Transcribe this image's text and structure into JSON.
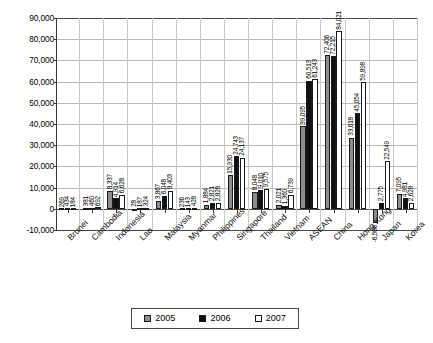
{
  "chart_data": {
    "type": "bar",
    "title": "",
    "xlabel": "",
    "ylabel": "",
    "ylim": [
      -10000,
      90000
    ],
    "yticks": [
      "-10,000",
      "0",
      "10,000",
      "20,000",
      "30,000",
      "40,000",
      "50,000",
      "60,000",
      "70,000",
      "80,000",
      "90,000"
    ],
    "grid": true,
    "legend_position": "bottom",
    "categories": [
      "Brunei",
      "Cambodia",
      "Indonesia",
      "Lao",
      "Malaysia",
      "Myanmar",
      "Philippines",
      "Singapore",
      "Thailand",
      "Vietnam",
      "ASEAN",
      "China",
      "Hong Kong",
      "Japan",
      "Korea"
    ],
    "series": [
      {
        "name": "2005",
        "color": "#8c8c8c",
        "values": [
          269,
          381,
          8337,
          28,
          3867,
          236,
          1884,
          15930,
          8048,
          2021,
          39095,
          72406,
          33618,
          -6506,
          7095
        ],
        "labels": [
          "269",
          "381",
          "8,337",
          "28",
          "3,867",
          "236",
          "1,884",
          "15,930",
          "8,048",
          "2,021",
          "39,095",
          "72,406",
          "33,618",
          "-6,506",
          "7,095"
        ]
      },
      {
        "name": "2006",
        "color": "#101010",
        "values": [
          434,
          460,
          4914,
          187,
          6048,
          143,
          2821,
          24743,
          9010,
          1360,
          60513,
          72215,
          45054,
          2775,
          4981
        ],
        "labels": [
          "434",
          "460",
          "4,914",
          "187",
          "6,048",
          "143",
          "2,821",
          "24,743",
          "9,010",
          "1,360",
          "60,513",
          "72,215",
          "45,054",
          "2,775",
          "4,981"
        ]
      },
      {
        "name": "2007",
        "color": "#ffffff",
        "values": [
          184,
          692,
          6628,
          324,
          8403,
          428,
          2828,
          24137,
          9575,
          6739,
          61243,
          84021,
          59898,
          22549,
          2628
        ],
        "labels": [
          "184",
          "692",
          "6,628",
          "324",
          "8,403",
          "428",
          "2,828",
          "24,137",
          "9,575",
          "6,739",
          "61,243",
          "84,021",
          "59,898",
          "22,549",
          "2,628"
        ]
      }
    ]
  },
  "legend": {
    "items": [
      {
        "label": "2005"
      },
      {
        "label": "2006"
      },
      {
        "label": "2007"
      }
    ]
  }
}
